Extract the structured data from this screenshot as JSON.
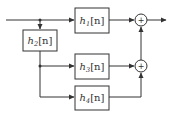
{
  "diagram": {
    "type": "block-diagram",
    "blocks": [
      {
        "id": "h1",
        "base": "h",
        "sub": "1",
        "arg": "[n]"
      },
      {
        "id": "h2",
        "base": "h",
        "sub": "2",
        "arg": "[n]"
      },
      {
        "id": "h3",
        "base": "h",
        "sub": "3",
        "arg": "[n]"
      },
      {
        "id": "h4",
        "base": "h",
        "sub": "4",
        "arg": "[n]"
      }
    ],
    "summers": [
      {
        "id": "sum1",
        "symbol": "+"
      },
      {
        "id": "sum2",
        "symbol": "+"
      }
    ],
    "connections": [
      "input -> h1",
      "input -> h2",
      "h2 -> h3",
      "h2 -> h4",
      "h1 -> sum1",
      "h3 -> sum2",
      "h4 -> sum2",
      "sum2 -> sum1",
      "sum1 -> output"
    ]
  }
}
